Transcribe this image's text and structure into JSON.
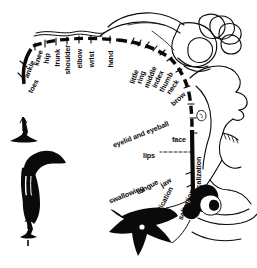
{
  "figure": {
    "name": "motor-homunculus-diagram",
    "ink_color": "#0a0a0a",
    "background_color": "#ffffff",
    "description_note": "Penfield motor homunculus: cortical representation arc with body-part labels"
  },
  "labels": [
    {
      "text": "toes",
      "x": 30,
      "y": 89,
      "rot": -62,
      "size": 7.2
    },
    {
      "text": "ankle",
      "x": 26,
      "y": 74,
      "rot": -68,
      "size": 7.2
    },
    {
      "text": "knee",
      "x": 36,
      "y": 62,
      "rot": -74,
      "size": 7.2
    },
    {
      "text": "hip",
      "x": 46,
      "y": 60,
      "rot": -82,
      "size": 7.2
    },
    {
      "text": "trunk",
      "x": 57,
      "y": 63,
      "rot": -88,
      "size": 7.2
    },
    {
      "text": "shoulder",
      "x": 68,
      "y": 71,
      "rot": -90,
      "size": 7.2
    },
    {
      "text": "elbow",
      "x": 80,
      "y": 65,
      "rot": -90,
      "size": 7.2
    },
    {
      "text": "wrist",
      "x": 92,
      "y": 64,
      "rot": -90,
      "size": 7.2
    },
    {
      "text": "hand",
      "x": 111,
      "y": 64,
      "rot": -90,
      "size": 7.2
    },
    {
      "text": "little",
      "x": 132,
      "y": 80,
      "rot": -72,
      "size": 7.2
    },
    {
      "text": "ring",
      "x": 139,
      "y": 80,
      "rot": -72,
      "size": 7.2
    },
    {
      "text": "middle",
      "x": 146,
      "y": 84,
      "rot": -68,
      "size": 7.2
    },
    {
      "text": "index",
      "x": 154,
      "y": 84,
      "rot": -65,
      "size": 7.2
    },
    {
      "text": "thumb",
      "x": 161,
      "y": 88,
      "rot": -62,
      "size": 7.2
    },
    {
      "text": "neck",
      "x": 168,
      "y": 90,
      "rot": -55,
      "size": 7.2
    },
    {
      "text": "brow",
      "x": 172,
      "y": 101,
      "rot": -42,
      "size": 7.2
    },
    {
      "text": "eyelid and eyeball",
      "x": 113,
      "y": 142,
      "rot": -22,
      "size": 7.2
    },
    {
      "text": "face",
      "x": 172,
      "y": 136,
      "rot": 0,
      "size": 7.2
    },
    {
      "text": "lips",
      "x": 143,
      "y": 152,
      "rot": 0,
      "size": 7.2
    },
    {
      "text": "vocalization",
      "x": 199,
      "y": 193,
      "rot": -90,
      "size": 7.2
    },
    {
      "text": "jaw",
      "x": 161,
      "y": 182,
      "rot": -32,
      "size": 7.2
    },
    {
      "text": "tongue",
      "x": 137,
      "y": 189,
      "rot": -28,
      "size": 7.2
    },
    {
      "text": "swallowing",
      "x": 109,
      "y": 198,
      "rot": -22,
      "size": 7.2
    },
    {
      "text": "mastication",
      "x": 153,
      "y": 218,
      "rot": -62,
      "size": 7.2
    },
    {
      "text": "salivation",
      "x": 180,
      "y": 216,
      "rot": -68,
      "size": 7.2
    }
  ]
}
